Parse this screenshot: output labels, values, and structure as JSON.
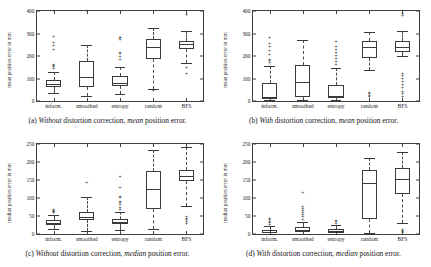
{
  "figure": {
    "categories": [
      "inform.",
      "smoothed",
      "entropy",
      "random",
      "BFS"
    ]
  },
  "panels": [
    {
      "id": "a",
      "position": "top-left",
      "caption_label": "(a)",
      "caption_emph1": "Without",
      "caption_mid": "distortion correction,",
      "caption_emph2": "mean",
      "caption_end": "position error.",
      "caption_full": "(a) Without distortion correction, mean position error.",
      "ylabel": "mean position error in mm",
      "yticks": [
        "0",
        "100",
        "200",
        "300",
        "400"
      ]
    },
    {
      "id": "b",
      "position": "top-right",
      "caption_label": "(b)",
      "caption_emph1": "With",
      "caption_mid": "distortion correction,",
      "caption_emph2": "mean",
      "caption_end": "position error.",
      "caption_full": "(b) With distortion correction, mean position error.",
      "ylabel": "mean position error in mm",
      "yticks": [
        "0",
        "100",
        "200",
        "300",
        "400"
      ]
    },
    {
      "id": "c",
      "position": "bottom-left",
      "caption_label": "(c)",
      "caption_emph1": "Without",
      "caption_mid": "distortion correction,",
      "caption_emph2": "median",
      "caption_end": "position error.",
      "caption_full": "(c) Without distortion correction, median position error.",
      "ylabel": "median position error in mm",
      "yticks": [
        "0",
        "50",
        "100",
        "150",
        "200",
        "250"
      ]
    },
    {
      "id": "d",
      "position": "bottom-right",
      "caption_label": "(d)",
      "caption_emph1": "With",
      "caption_mid": "distortion correction,",
      "caption_emph2": "median",
      "caption_end": "position error.",
      "caption_full": "(d) With distortion correction, median position error.",
      "ylabel": "median position error in mm",
      "yticks": [
        "0",
        "50",
        "100",
        "150",
        "200",
        "250"
      ]
    }
  ],
  "chart_data": [
    {
      "type": "box",
      "panel": "a",
      "title": "(a) Without distortion correction, mean position error.",
      "xlabel": "",
      "ylabel": "mean position error in mm",
      "ylim": [
        0,
        400
      ],
      "yticks": [
        0,
        100,
        200,
        300,
        400
      ],
      "grid": false,
      "legend": "none",
      "categories": [
        "inform.",
        "smoothed",
        "entropy",
        "random",
        "BFS"
      ],
      "boxes": [
        {
          "category": "inform.",
          "whisker_low": 35,
          "q1": 62,
          "median": 75,
          "q3": 95,
          "whisker_high": 128,
          "outliers": [
            143,
            150,
            155,
            162,
            228,
            243,
            258,
            285,
            398
          ]
        },
        {
          "category": "smoothed",
          "whisker_low": 22,
          "q1": 62,
          "median": 105,
          "q3": 178,
          "whisker_high": 250,
          "outliers": [
            398
          ]
        },
        {
          "category": "entropy",
          "whisker_low": 30,
          "q1": 68,
          "median": 82,
          "q3": 113,
          "whisker_high": 150,
          "outliers": [
            183,
            196,
            210,
            215,
            272,
            278,
            281
          ]
        },
        {
          "category": "random",
          "whisker_low": 52,
          "q1": 186,
          "median": 238,
          "q3": 277,
          "whisker_high": 323,
          "outliers": [
            44,
            47
          ]
        },
        {
          "category": "BFS",
          "whisker_low": 168,
          "q1": 233,
          "median": 252,
          "q3": 268,
          "whisker_high": 310,
          "outliers": [
            118,
            145,
            382
          ]
        }
      ]
    },
    {
      "type": "box",
      "panel": "b",
      "title": "(b) With distortion correction, mean position error.",
      "xlabel": "",
      "ylabel": "mean position error in mm",
      "ylim": [
        0,
        400
      ],
      "yticks": [
        0,
        100,
        200,
        300,
        400
      ],
      "grid": false,
      "legend": "none",
      "categories": [
        "inform.",
        "smoothed",
        "entropy",
        "random",
        "BFS"
      ],
      "boxes": [
        {
          "category": "inform.",
          "whisker_low": 3,
          "q1": 8,
          "median": 18,
          "q3": 78,
          "whisker_high": 155,
          "outliers": [
            168,
            178,
            182,
            206,
            222,
            238,
            253,
            282
          ]
        },
        {
          "category": "smoothed",
          "whisker_low": 5,
          "q1": 18,
          "median": 85,
          "q3": 160,
          "whisker_high": 272,
          "outliers": []
        },
        {
          "category": "entropy",
          "whisker_low": 4,
          "q1": 12,
          "median": 22,
          "q3": 72,
          "whisker_high": 148,
          "outliers": [
            160,
            172,
            185,
            198,
            212,
            226,
            240,
            262
          ]
        },
        {
          "category": "random",
          "whisker_low": 136,
          "q1": 192,
          "median": 238,
          "q3": 268,
          "whisker_high": 305,
          "outliers": [
            18,
            22,
            30,
            35
          ]
        },
        {
          "category": "BFS",
          "whisker_low": 202,
          "q1": 218,
          "median": 240,
          "q3": 266,
          "whisker_high": 312,
          "outliers": [
            18,
            30,
            42,
            58,
            72,
            86,
            100,
            112,
            118,
            378,
            388,
            398
          ]
        }
      ]
    },
    {
      "type": "box",
      "panel": "c",
      "title": "(c) Without distortion correction, median position error.",
      "xlabel": "",
      "ylabel": "median position error in mm",
      "ylim": [
        0,
        250
      ],
      "yticks": [
        0,
        50,
        100,
        150,
        200,
        250
      ],
      "grid": false,
      "legend": "none",
      "categories": [
        "inform.",
        "smoothed",
        "entropy",
        "random",
        "BFS"
      ],
      "boxes": [
        {
          "category": "inform.",
          "whisker_low": 14,
          "q1": 25,
          "median": 31,
          "q3": 38,
          "whisker_high": 52,
          "outliers": [
            57,
            60,
            62,
            64,
            66
          ]
        },
        {
          "category": "smoothed",
          "whisker_low": 9,
          "q1": 38,
          "median": 48,
          "q3": 60,
          "whisker_high": 103,
          "outliers": [
            143
          ]
        },
        {
          "category": "entropy",
          "whisker_low": 10,
          "q1": 27,
          "median": 33,
          "q3": 42,
          "whisker_high": 62,
          "outliers": [
            68,
            72,
            80,
            85,
            90,
            99,
            103,
            128,
            157
          ]
        },
        {
          "category": "random",
          "whisker_low": 14,
          "q1": 70,
          "median": 126,
          "q3": 175,
          "whisker_high": 233,
          "outliers": []
        },
        {
          "category": "BFS",
          "whisker_low": 78,
          "q1": 146,
          "median": 161,
          "q3": 178,
          "whisker_high": 241,
          "outliers": [
            28,
            33,
            38,
            43,
            48
          ]
        }
      ]
    },
    {
      "type": "box",
      "panel": "d",
      "title": "(d) With distortion correction, median position error.",
      "xlabel": "",
      "ylabel": "median position error in mm",
      "ylim": [
        0,
        250
      ],
      "yticks": [
        0,
        50,
        100,
        150,
        200,
        250
      ],
      "grid": false,
      "legend": "none",
      "categories": [
        "inform.",
        "smoothed",
        "entropy",
        "random",
        "BFS"
      ],
      "boxes": [
        {
          "category": "inform.",
          "whisker_low": 1,
          "q1": 3,
          "median": 6,
          "q3": 11,
          "whisker_high": 22,
          "outliers": [
            26,
            30,
            34,
            38,
            42
          ]
        },
        {
          "category": "smoothed",
          "whisker_low": 1,
          "q1": 6,
          "median": 12,
          "q3": 20,
          "whisker_high": 34,
          "outliers": [
            40,
            46,
            52,
            58,
            64,
            70,
            76,
            115
          ]
        },
        {
          "category": "entropy",
          "whisker_low": 1,
          "q1": 4,
          "median": 8,
          "q3": 14,
          "whisker_high": 24,
          "outliers": [
            28,
            32,
            36
          ]
        },
        {
          "category": "random",
          "whisker_low": 4,
          "q1": 41,
          "median": 141,
          "q3": 178,
          "whisker_high": 212,
          "outliers": []
        },
        {
          "category": "BFS",
          "whisker_low": 30,
          "q1": 112,
          "median": 152,
          "q3": 182,
          "whisker_high": 228,
          "outliers": [
            3,
            5,
            8,
            11
          ]
        }
      ]
    }
  ]
}
